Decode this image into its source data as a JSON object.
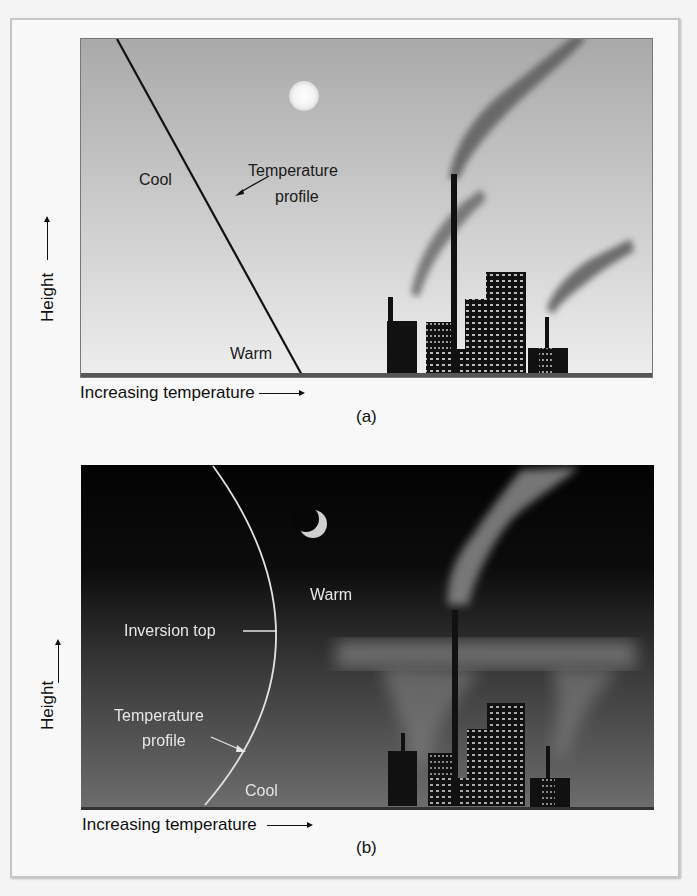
{
  "figure": {
    "panel_a": {
      "caption": "(a)",
      "x_axis_label": "Increasing temperature",
      "y_axis_label": "Height",
      "labels": {
        "cool": "Cool",
        "warm": "Warm",
        "temperature_profile_line1": "Temperature",
        "temperature_profile_line2": "profile"
      },
      "scene": "daytime",
      "celestial": "sun"
    },
    "panel_b": {
      "caption": "(b)",
      "x_axis_label": "Increasing temperature",
      "y_axis_label": "Height",
      "labels": {
        "warm": "Warm",
        "cool": "Cool",
        "inversion_top": "Inversion top",
        "temperature_profile_line1": "Temperature",
        "temperature_profile_line2": "profile"
      },
      "scene": "nighttime",
      "celestial": "crescent moon"
    }
  },
  "colors": {
    "panel_a_sky_top": "#a9a9a9",
    "panel_a_sky_bottom": "#eeeeee",
    "panel_b_sky_top": "#050505",
    "panel_b_sky_bottom": "#6e6e6e",
    "buildings": "#111111",
    "smoke": "#6a6a6a"
  }
}
